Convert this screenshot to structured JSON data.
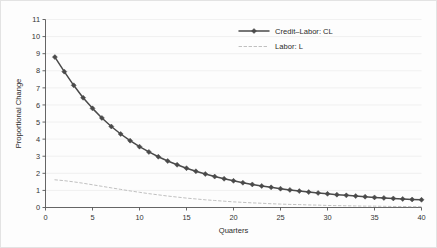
{
  "chart_data": {
    "type": "line",
    "title": "",
    "xlabel": "Quarters",
    "ylabel": "Proportional Change",
    "xlim": [
      0,
      40
    ],
    "ylim": [
      0,
      11
    ],
    "xticks": [
      0,
      5,
      10,
      15,
      20,
      25,
      30,
      35,
      40
    ],
    "yticks": [
      0,
      1,
      2,
      3,
      4,
      5,
      6,
      7,
      8,
      9,
      10,
      11
    ],
    "xtick_labels": [
      "0",
      "5",
      "10",
      "15",
      "20",
      "25",
      "30",
      "35",
      "40"
    ],
    "ytick_labels": [
      "0",
      "1",
      "2",
      "3",
      "4",
      "5",
      "6",
      "7",
      "8",
      "9",
      "10",
      "11"
    ],
    "grid": "horizontal-faint",
    "legend_position": "top-right",
    "x": [
      1,
      2,
      3,
      4,
      5,
      6,
      7,
      8,
      9,
      10,
      11,
      12,
      13,
      14,
      15,
      16,
      17,
      18,
      19,
      20,
      21,
      22,
      23,
      24,
      25,
      26,
      27,
      28,
      29,
      30,
      31,
      32,
      33,
      34,
      35,
      36,
      37,
      38,
      39,
      40
    ],
    "series": [
      {
        "name": "Credit-Labor: CL",
        "legend_label": "Credit–Labor: CL",
        "style": "solid",
        "marker": "diamond",
        "color": "#4a4a4a",
        "values": [
          8.8,
          7.95,
          7.15,
          6.42,
          5.8,
          5.24,
          4.74,
          4.3,
          3.91,
          3.56,
          3.25,
          2.97,
          2.72,
          2.5,
          2.3,
          2.12,
          1.96,
          1.81,
          1.68,
          1.56,
          1.45,
          1.35,
          1.26,
          1.18,
          1.1,
          1.03,
          0.96,
          0.9,
          0.85,
          0.8,
          0.75,
          0.71,
          0.67,
          0.63,
          0.59,
          0.56,
          0.53,
          0.5,
          0.47,
          0.45
        ]
      },
      {
        "name": "Labor: L",
        "legend_label": "Labor: L",
        "style": "dashed",
        "marker": "none",
        "color": "#b9b9b9",
        "values": [
          1.62,
          1.57,
          1.5,
          1.42,
          1.33,
          1.24,
          1.15,
          1.06,
          0.97,
          0.89,
          0.81,
          0.74,
          0.67,
          0.61,
          0.55,
          0.5,
          0.45,
          0.41,
          0.37,
          0.33,
          0.3,
          0.27,
          0.25,
          0.22,
          0.2,
          0.18,
          0.17,
          0.15,
          0.14,
          0.12,
          0.11,
          0.1,
          0.09,
          0.08,
          0.08,
          0.07,
          0.06,
          0.06,
          0.05,
          0.05
        ]
      }
    ]
  },
  "legend": {
    "entries": [
      {
        "label": "Credit–Labor: CL"
      },
      {
        "label": "Labor: L"
      }
    ]
  },
  "axes": {
    "x_title": "Quarters",
    "y_title": "Proportional Change"
  },
  "colors": {
    "series_cl": "#4a4a4a",
    "series_l": "#b9b9b9",
    "grid": "#ebebeb",
    "axis": "#555555",
    "background": "#fdfdfd"
  }
}
